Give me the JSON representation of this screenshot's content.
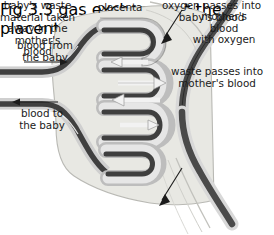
{
  "figure": {
    "title": "placenta",
    "caption": "Fig 3.3 gas exchange at the placenta"
  },
  "labels": {
    "placenta": "placenta",
    "blood_from_baby": "blood from\nthe baby",
    "blood_to_baby": "blood to\nthe baby",
    "mothers_blood_with_oxygen": "mother's\nblood\nwith oxygen",
    "waste_passes": "waste passes into\nmother's blood",
    "oxygen_passes": "oxygen passes into\nbaby's blood",
    "babys_waste": "baby's waste\nmaterial taken\naway in the\nmother's\nblood"
  },
  "icons": {
    "arrow_blood_from_baby": "arrow-right-icon",
    "arrow_blood_to_baby": "arrow-left-icon",
    "arrow_mothers_inflow": "arrow-down-icon",
    "arrow_mothers_outflow": "arrow-down-icon",
    "arrow_waste_out": "arrow-right-icon",
    "arrow_oxygen_in": "arrow-left-icon"
  },
  "colors": {
    "vessel_dark": "#3b3b3b",
    "vessel_outline": "#000000",
    "vessel_mid": "#8c8c8c",
    "vessel_light": "#d8d8d8",
    "placenta_fill": "#e8e8e3",
    "placenta_edge": "#b9b9b4",
    "background": "#ffffff",
    "text": "#1b1b1b"
  }
}
